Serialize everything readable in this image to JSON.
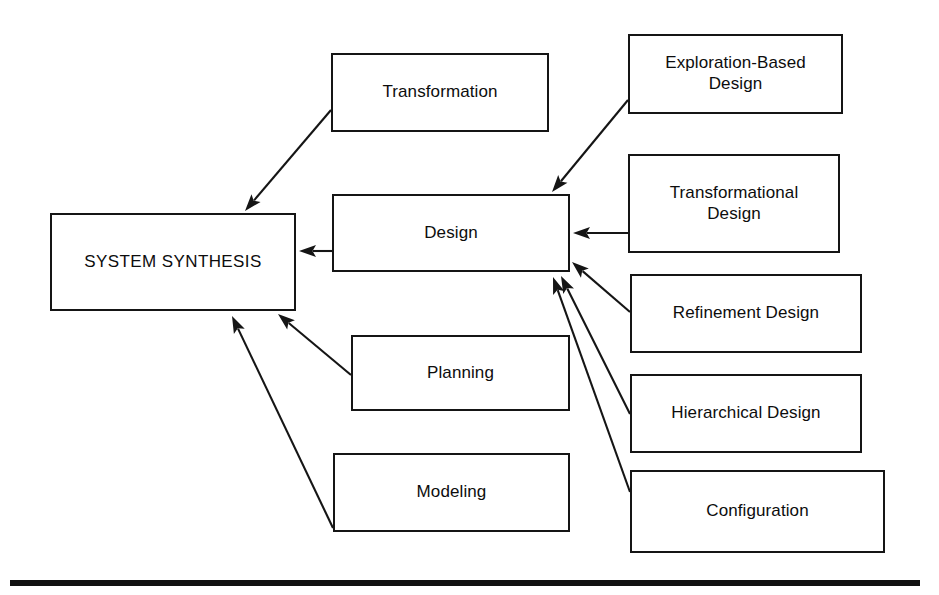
{
  "figure": {
    "width": 939,
    "height": 595,
    "background": "#ffffff",
    "line_color": "#151515",
    "text_color": "#0d0d0d"
  },
  "nodes": [
    {
      "id": "system-synthesis",
      "label": "SYSTEM SYNTHESIS",
      "x": 50,
      "y": 213,
      "w": 246,
      "h": 98,
      "font_size": 17,
      "variant": "root"
    },
    {
      "id": "transformation",
      "label": "Transformation",
      "x": 331,
      "y": 53,
      "w": 218,
      "h": 79,
      "font_size": 17,
      "variant": "normal"
    },
    {
      "id": "design",
      "label": "Design",
      "x": 332,
      "y": 194,
      "w": 238,
      "h": 78,
      "font_size": 17,
      "variant": "normal"
    },
    {
      "id": "planning",
      "label": "Planning",
      "x": 351,
      "y": 335,
      "w": 219,
      "h": 76,
      "font_size": 17,
      "variant": "normal"
    },
    {
      "id": "modeling",
      "label": "Modeling",
      "x": 333,
      "y": 453,
      "w": 237,
      "h": 79,
      "font_size": 17,
      "variant": "normal"
    },
    {
      "id": "exploration-based-design",
      "label": "Exploration-Based\nDesign",
      "x": 628,
      "y": 34,
      "w": 215,
      "h": 80,
      "font_size": 17,
      "variant": "normal"
    },
    {
      "id": "transformational-design",
      "label": "Transformational\nDesign",
      "x": 628,
      "y": 154,
      "w": 212,
      "h": 99,
      "font_size": 17,
      "variant": "normal"
    },
    {
      "id": "refinement-design",
      "label": "Refinement Design",
      "x": 630,
      "y": 274,
      "w": 232,
      "h": 79,
      "font_size": 17,
      "variant": "normal"
    },
    {
      "id": "hierarchical-design",
      "label": "Hierarchical Design",
      "x": 630,
      "y": 374,
      "w": 232,
      "h": 79,
      "font_size": 17,
      "variant": "normal"
    },
    {
      "id": "configuration",
      "label": "Configuration",
      "x": 630,
      "y": 470,
      "w": 255,
      "h": 83,
      "font_size": 17,
      "variant": "normal"
    }
  ],
  "edges": [
    {
      "id": "transformation-to-system-synthesis",
      "from": "transformation",
      "to": "system-synthesis",
      "x1": 331,
      "y1": 110,
      "x2": 245,
      "y2": 211
    },
    {
      "id": "design-to-system-synthesis",
      "from": "design",
      "to": "system-synthesis",
      "x1": 332,
      "y1": 251,
      "x2": 299,
      "y2": 251
    },
    {
      "id": "planning-to-system-synthesis",
      "from": "planning",
      "to": "system-synthesis",
      "x1": 351,
      "y1": 375,
      "x2": 278,
      "y2": 314
    },
    {
      "id": "modeling-to-system-synthesis",
      "from": "modeling",
      "to": "system-synthesis",
      "x1": 333,
      "y1": 528,
      "x2": 232,
      "y2": 316
    },
    {
      "id": "exploration-based-design-to-design",
      "from": "exploration-based-design",
      "to": "design",
      "x1": 628,
      "y1": 100,
      "x2": 552,
      "y2": 192
    },
    {
      "id": "transformational-design-to-design",
      "from": "transformational-design",
      "to": "design",
      "x1": 628,
      "y1": 233,
      "x2": 573,
      "y2": 233
    },
    {
      "id": "refinement-design-to-design",
      "from": "refinement-design",
      "to": "design",
      "x1": 630,
      "y1": 312,
      "x2": 572,
      "y2": 262
    },
    {
      "id": "hierarchical-design-to-design",
      "from": "hierarchical-design",
      "to": "design",
      "x1": 630,
      "y1": 414,
      "x2": 561,
      "y2": 276
    },
    {
      "id": "configuration-to-design",
      "from": "configuration",
      "to": "design",
      "x1": 630,
      "y1": 492,
      "x2": 553,
      "y2": 277
    }
  ],
  "bottom_rule": {
    "x": 10,
    "y": 580,
    "w": 910,
    "h": 6
  }
}
